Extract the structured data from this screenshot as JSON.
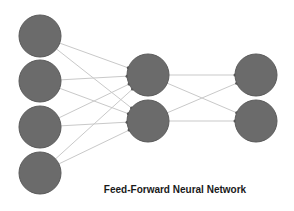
{
  "title": "Feed-Forward Neural Network",
  "colors": {
    "node": "#6b6b6b",
    "node_stroke": "#5a5a5a",
    "edge": "#c9c9c9",
    "text": "#1a1a1a"
  },
  "layers": [
    {
      "name": "input",
      "nodes": [
        {
          "x": 40,
          "y": 36
        },
        {
          "x": 40,
          "y": 81
        },
        {
          "x": 40,
          "y": 127
        },
        {
          "x": 40,
          "y": 173
        }
      ]
    },
    {
      "name": "hidden",
      "nodes": [
        {
          "x": 148,
          "y": 75
        },
        {
          "x": 148,
          "y": 121
        }
      ]
    },
    {
      "name": "output",
      "nodes": [
        {
          "x": 256,
          "y": 75
        },
        {
          "x": 256,
          "y": 121
        }
      ]
    }
  ],
  "node_radius": 21
}
